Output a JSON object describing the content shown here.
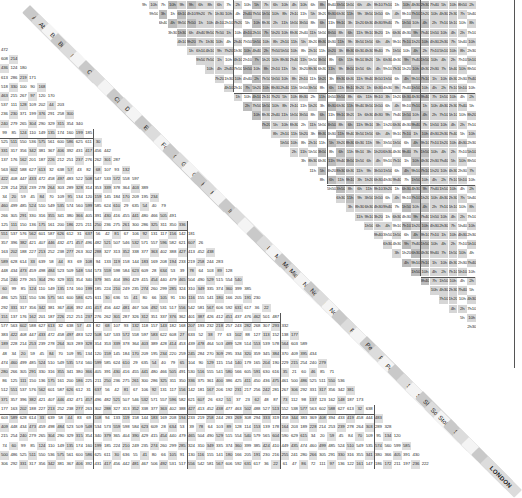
{
  "legend": {
    "lower_left": "Distance in miles",
    "upper_right": "Journey time in hours (h) / minutes (m)"
  },
  "towns": [
    "Aberdeen",
    "Aberystwyth",
    "Barnstaple",
    "Birmingham",
    "Brighton",
    "Bristol",
    "Cambridge",
    "Cardiff",
    "Carlisle",
    "Carmarthen",
    "Dorchester",
    "Dover",
    "Edinburgh",
    "Exeter",
    "Fort William",
    "Glasgow",
    "Gloucester",
    "Guildford",
    "Hereford",
    "Holyhead",
    "Hull",
    "Inverness",
    "Kendal",
    "Leeds",
    "Lincoln",
    "Liverpool",
    "Maidstone",
    "Manchester",
    "Middlesbrough",
    "Newcastle",
    "Northampton",
    "Norwich",
    "Nottingham",
    "Oxford",
    "Penzance",
    "Perth",
    "Peterborough",
    "Plymouth",
    "Portsmouth",
    "Preston",
    "Salisbury",
    "Sheffield",
    "Shrewsbury",
    "Southampton",
    "Stoke-on-Trent",
    "Stranraer",
    "Taunton",
    "Wick",
    "York",
    "LONDON"
  ],
  "distance_rows_sample": [
    [
      "472"
    ],
    [
      "608",
      "214"
    ],
    [
      "436",
      "124",
      "180"
    ],
    [
      "613",
      "286",
      "219",
      "171"
    ],
    [
      "518",
      "330",
      "100",
      "90",
      "168"
    ],
    [
      "463",
      "215",
      "267",
      "97",
      "120",
      "170"
    ],
    [
      "537",
      "111",
      "128",
      "109",
      "202",
      "44",
      "203"
    ],
    [
      "236",
      "230",
      "371",
      "199",
      "376",
      "291",
      "258",
      "300"
    ]
  ],
  "distance_bottom_row_sample": [
    "158",
    "339",
    "216",
    "121",
    "54",
    "135",
    "59",
    "153",
    "314",
    "215",
    "125",
    "78",
    "413",
    "200",
    "512",
    "410",
    "182",
    "31",
    "138",
    "282",
    "86",
    "174",
    "200",
    "201",
    "143",
    "216",
    "59"
  ],
  "time_top_row_sample": [
    "9h",
    "10h",
    "7h",
    "10h",
    "9h",
    "9h",
    "6h",
    "8h",
    "6h",
    "7h",
    "2h",
    "10h",
    "5h",
    "7h",
    "6h",
    "10h",
    "4h",
    "10h",
    "6h",
    "8h"
  ],
  "colors": {
    "time_cell": "#d6d6d6",
    "time_cell_dark": "#bcbcbc",
    "distance_cell": "#ffffff",
    "label_band": "#efefef",
    "label_bg": "#c9c9c9",
    "grid_line": "#555555"
  }
}
